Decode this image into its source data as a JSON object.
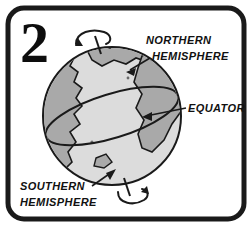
{
  "figure": {
    "numeral": "2",
    "labels": {
      "northern_line1": "NORTHERN",
      "northern_line2": "HEMISPHERE",
      "equator": "EQUATOR",
      "southern_line1": "SOUTHERN",
      "southern_line2": "HEMISPHERE"
    },
    "icons": {
      "north_rotation": "rotation-arrow-icon",
      "south_rotation": "rotation-arrow-icon",
      "northern_pointer": "arrow-pointer-icon",
      "equator_pointer": "arrow-pointer-icon",
      "southern_pointer": "arrow-pointer-icon"
    },
    "colors": {
      "frame": "#1a1a1a",
      "background": "#ffffff",
      "ocean": "#dcdcdc",
      "land": "#a9a9a9",
      "outline": "#1a1a1a",
      "text": "#111111"
    }
  }
}
